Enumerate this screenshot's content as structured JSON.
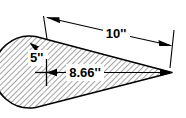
{
  "figure": {
    "shape_name": "teardrop-profile",
    "fill_pattern": "diagonal-hatch",
    "colors": {
      "outline": "#000000",
      "hatch": "#595959",
      "background": "#ffffff",
      "label_background": "#ffffff"
    },
    "dimensions": [
      {
        "id": "overall-length",
        "value": "10''",
        "style": "linear-dimension",
        "arrows": "both-ends"
      },
      {
        "id": "center-to-tip",
        "value": "8.66''",
        "style": "linear-dimension",
        "arrows": "both-ends"
      },
      {
        "id": "arc-radius",
        "value": "5''",
        "style": "radius-leader",
        "arrows": "one-end"
      }
    ],
    "center_mark": {
      "id": "circle-center",
      "symbol": "cross"
    }
  }
}
